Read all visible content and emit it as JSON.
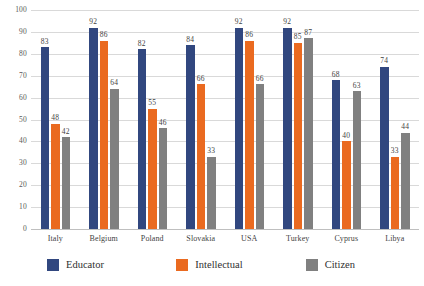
{
  "chart_data": {
    "type": "bar",
    "title": "",
    "subtitle": "",
    "xlabel": "",
    "ylabel": "",
    "ylim": [
      0,
      100
    ],
    "ytick_step": 10,
    "yticks": [
      100,
      90,
      80,
      70,
      60,
      50,
      40,
      30,
      20,
      10,
      0
    ],
    "grid": "horizontal",
    "legend_position": "bottom",
    "categories": [
      "Italy",
      "Belgium",
      "Poland",
      "Slovakia",
      "USA",
      "Turkey",
      "Cyprus",
      "Libya"
    ],
    "series": [
      {
        "name": "Educator",
        "color": "#31477f",
        "values": [
          83,
          92,
          82,
          84,
          92,
          92,
          68,
          74
        ]
      },
      {
        "name": "Intellectual",
        "color": "#ea6a20",
        "values": [
          48,
          86,
          55,
          66,
          86,
          85,
          40,
          33
        ]
      },
      {
        "name": "Citizen",
        "color": "#808080",
        "values": [
          42,
          64,
          46,
          33,
          66,
          87,
          63,
          44
        ]
      }
    ]
  }
}
